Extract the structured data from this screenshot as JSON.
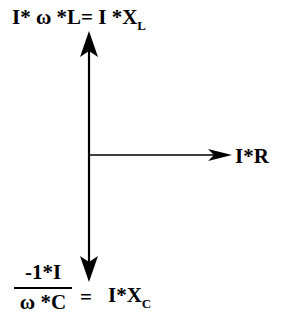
{
  "diagram": {
    "colors": {
      "stroke": "#000000",
      "background": "#ffffff"
    },
    "labels": {
      "inductive": {
        "lhs": "I* ω *L",
        "eq": "=",
        "rhs": "I *X",
        "sub": "L"
      },
      "resistive": {
        "text": "I*R"
      },
      "capacitive": {
        "numerator": "-1*I",
        "denominator": "ω *C",
        "eq": "=",
        "rhs": "I*X",
        "sub": "C"
      }
    },
    "vectors": [
      {
        "name": "inductive",
        "direction": "up",
        "from": [
          89,
          155
        ],
        "to": [
          89,
          31
        ]
      },
      {
        "name": "resistive",
        "direction": "right",
        "from": [
          89,
          155
        ],
        "to": [
          232,
          155
        ]
      },
      {
        "name": "capacitive",
        "direction": "down",
        "from": [
          89,
          155
        ],
        "to": [
          89,
          282
        ]
      }
    ]
  }
}
